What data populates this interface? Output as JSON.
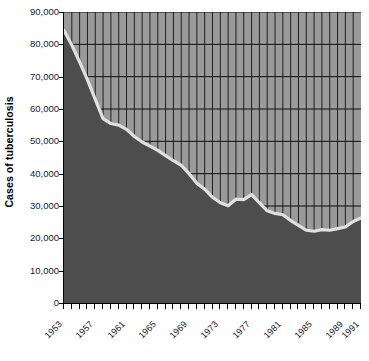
{
  "chart_data": {
    "type": "area",
    "title": "",
    "subtitle": "",
    "xlabel": "",
    "ylabel": "Cases of tuberculosis",
    "xlim": [
      1953,
      1991
    ],
    "ylim": [
      0,
      90000
    ],
    "grid": true,
    "legend": null,
    "y_ticks": [
      0,
      10000,
      20000,
      30000,
      40000,
      50000,
      60000,
      70000,
      80000,
      90000
    ],
    "y_tick_labels": [
      "0",
      "10,000",
      "20,000",
      "30,000",
      "40,000",
      "50,000",
      "60,000",
      "70,000",
      "80,000",
      "90,000"
    ],
    "x_ticks": [
      1953,
      1954,
      1955,
      1956,
      1957,
      1958,
      1959,
      1960,
      1961,
      1962,
      1963,
      1964,
      1965,
      1966,
      1967,
      1968,
      1969,
      1970,
      1971,
      1972,
      1973,
      1974,
      1975,
      1976,
      1977,
      1978,
      1979,
      1980,
      1981,
      1982,
      1983,
      1984,
      1985,
      1986,
      1987,
      1988,
      1989,
      1990,
      1991
    ],
    "x_tick_labels": [
      "1953",
      "1957",
      "1961",
      "1965",
      "1969",
      "1973",
      "1977",
      "1981",
      "1985",
      "1989",
      "1991"
    ],
    "x_tick_label_years": [
      1953,
      1957,
      1961,
      1965,
      1969,
      1973,
      1977,
      1981,
      1985,
      1989,
      1991
    ],
    "x": [
      1953,
      1954,
      1955,
      1956,
      1957,
      1958,
      1959,
      1960,
      1961,
      1962,
      1963,
      1964,
      1965,
      1966,
      1967,
      1968,
      1969,
      1970,
      1971,
      1972,
      1973,
      1974,
      1975,
      1976,
      1977,
      1978,
      1979,
      1980,
      1981,
      1982,
      1983,
      1984,
      1985,
      1986,
      1987,
      1988,
      1989,
      1990,
      1991
    ],
    "values": [
      84300,
      79800,
      74500,
      69000,
      63000,
      57000,
      55500,
      55000,
      53700,
      51500,
      49800,
      48500,
      47200,
      45600,
      44000,
      42600,
      40000,
      37000,
      35200,
      32700,
      31000,
      30100,
      32100,
      32000,
      33500,
      31000,
      28500,
      27700,
      27300,
      25500,
      24000,
      22500,
      22200,
      22700,
      22500,
      23000,
      23500,
      25200,
      26300
    ],
    "series_name": "Cases of tuberculosis",
    "colors": {
      "area_fill": "#4d4d4d",
      "line": "#e0e0e0",
      "plot_background": "#9a9a9a",
      "gridline": "#000000",
      "axis": "#000000",
      "text": "#1a1a1a"
    }
  }
}
